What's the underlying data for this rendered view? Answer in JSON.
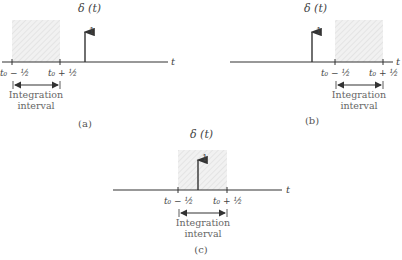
{
  "figure": {
    "panels": [
      {
        "id": "a",
        "caption": "(a)",
        "title": "δ (t)",
        "impulse_label": "1",
        "axis_label": "t",
        "tick_left": "t₀ − ½",
        "tick_right": "t₀ + ½",
        "interval_label_1": "Integration",
        "interval_label_2": "interval",
        "description": "Impulse lies to the right of the integration interval"
      },
      {
        "id": "b",
        "caption": "(b)",
        "title": "δ (t)",
        "impulse_label": "1",
        "axis_label": "t",
        "tick_left": "t₀ − ½",
        "tick_right": "t₀ + ½",
        "interval_label_1": "Integration",
        "interval_label_2": "interval",
        "description": "Impulse lies to the left of the integration interval"
      },
      {
        "id": "c",
        "caption": "(c)",
        "title": "δ (t)",
        "impulse_label": "1",
        "axis_label": "t",
        "tick_left": "t₀ − ½",
        "tick_right": "t₀ + ½",
        "interval_label_1": "Integration",
        "interval_label_2": "interval",
        "description": "Impulse lies inside the integration interval"
      }
    ],
    "colors": {
      "line": "#333333",
      "shade": "#e9e9e9",
      "text": "#444444"
    }
  }
}
